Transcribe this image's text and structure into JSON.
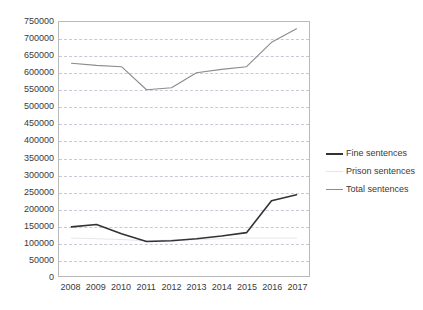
{
  "chart_data": {
    "type": "line",
    "title": "",
    "subtitle": "",
    "xlabel": "",
    "ylabel": "",
    "categories": [
      "2008",
      "2009",
      "2010",
      "2011",
      "2012",
      "2013",
      "2014",
      "2015",
      "2016",
      "2017"
    ],
    "x": [
      2008,
      2009,
      2010,
      2011,
      2012,
      2013,
      2014,
      2015,
      2016,
      2017
    ],
    "ylim": [
      0,
      750000
    ],
    "yticks": [
      0,
      50000,
      100000,
      150000,
      200000,
      250000,
      300000,
      350000,
      400000,
      450000,
      500000,
      550000,
      600000,
      650000,
      700000,
      750000
    ],
    "ytick_labels": [
      "0",
      "50000",
      "100000",
      "150000",
      "200000",
      "250000",
      "300000",
      "350000",
      "400000",
      "450000",
      "500000",
      "550000",
      "600000",
      "650000",
      "700000",
      "750000"
    ],
    "grid": true,
    "grid_axis": "y",
    "legend_position": "right",
    "series": [
      {
        "name": "Fine sentences",
        "color": "#333333",
        "values": [
          145000,
          152000,
          125000,
          102000,
          104000,
          110000,
          118000,
          128000,
          222000,
          240000
        ]
      },
      {
        "name": "Prison sentences",
        "color": "#e6e6e6",
        "values": [
          112000,
          110000,
          108000,
          104000,
          106000,
          108000,
          110000,
          112000,
          112000,
          112000
        ]
      },
      {
        "name": "Total sentences",
        "color": "#8c8c8c",
        "values": [
          628000,
          622000,
          618000,
          550000,
          556000,
          600000,
          610000,
          618000,
          690000,
          730000
        ]
      }
    ]
  },
  "legend": {
    "items": [
      {
        "label": "Fine sentences"
      },
      {
        "label": "Prison sentences"
      },
      {
        "label": "Total sentences"
      }
    ]
  },
  "colors": {
    "fine": "#333333",
    "prison": "#e6e6e6",
    "total": "#8c8c8c",
    "grid": "#c8c8d8",
    "frame": "#b9b9b9",
    "text": "#3a3a3a",
    "background": "#ffffff"
  }
}
